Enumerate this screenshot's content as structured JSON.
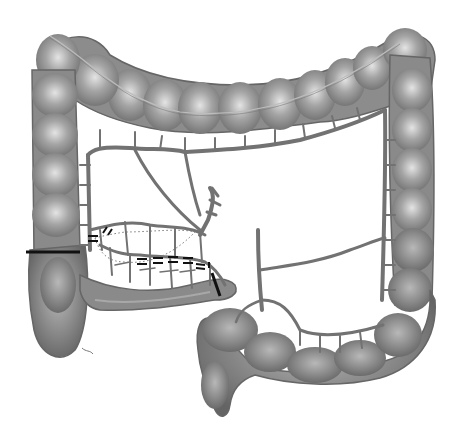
{
  "diagram": {
    "colors": {
      "background": "#ffffff",
      "bowel_fill": "#8e8e8e",
      "bowel_dark": "#6a6a6a",
      "bowel_highlight": "#d8d8d8",
      "vessel": "#727272",
      "cut_line": "#111111",
      "dotted_margin": "#7a7a7a"
    },
    "segments": [
      {
        "id": "ascending-colon"
      },
      {
        "id": "transverse-colon"
      },
      {
        "id": "descending-colon"
      },
      {
        "id": "sigmoid-colon"
      },
      {
        "id": "cecum"
      },
      {
        "id": "terminal-ileum"
      }
    ],
    "annotations": [
      {
        "id": "resection-line-colon",
        "style": "solid"
      },
      {
        "id": "ligation-marks-arcade",
        "style": "double-dash"
      },
      {
        "id": "resection-line-ileum",
        "style": "solid"
      },
      {
        "id": "resection-margin",
        "style": "dotted"
      }
    ]
  }
}
